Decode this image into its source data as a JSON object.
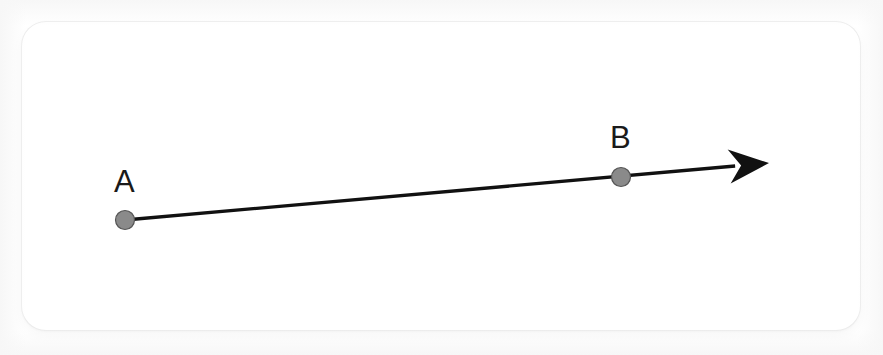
{
  "figure": {
    "kind": "ray-diagram",
    "background_color": "#ffffff",
    "card": {
      "fill": "#ffffff",
      "border_color": "#ececec",
      "corner_radius": 24,
      "x": 22,
      "y": 22,
      "width": 838,
      "height": 308
    },
    "ray": {
      "stroke_color": "#111111",
      "stroke_width": 3.4,
      "start_x": 125,
      "start_y": 220,
      "tip_x": 769,
      "tip_y": 163,
      "arrowhead": {
        "name": "arrowhead",
        "style": "solid-filled-triangle",
        "fill": "#111111",
        "length": 40,
        "half_width": 17
      }
    },
    "points": [
      {
        "id": "A",
        "label": "A",
        "x": 125,
        "y": 220,
        "radius": 9.5,
        "fill": "#8a8a8a",
        "stroke": "#555555",
        "label_x": 114,
        "label_y": 166
      },
      {
        "id": "B",
        "label": "B",
        "x": 621,
        "y": 177,
        "radius": 9.5,
        "fill": "#8a8a8a",
        "stroke": "#555555",
        "label_x": 610,
        "label_y": 122
      }
    ]
  }
}
